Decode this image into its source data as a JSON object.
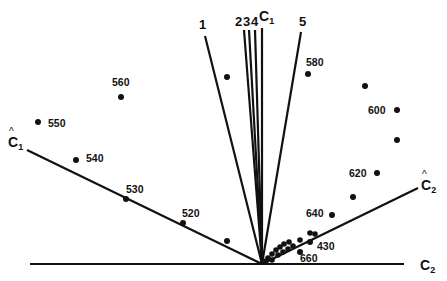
{
  "diagram": {
    "origin_label": "",
    "axes": [
      {
        "id": "c2",
        "label": "C",
        "subscript": "2",
        "hat": false
      },
      {
        "id": "c1-hat",
        "label": "C",
        "subscript": "1",
        "hat": true
      },
      {
        "id": "c2-hat",
        "label": "C",
        "subscript": "2",
        "hat": true
      }
    ],
    "vectors": [
      {
        "id": "v1",
        "label": "1"
      },
      {
        "id": "v2",
        "label": "2"
      },
      {
        "id": "v3",
        "label": "3"
      },
      {
        "id": "v4",
        "label": "4"
      },
      {
        "id": "vc1",
        "label": "C",
        "subscript": "1"
      },
      {
        "id": "v5",
        "label": "5"
      }
    ],
    "points": [
      {
        "label": "550"
      },
      {
        "label": "560"
      },
      {
        "label": "540"
      },
      {
        "label": "530"
      },
      {
        "label": "520"
      },
      {
        "label": ""
      },
      {
        "label": ""
      },
      {
        "label": "580"
      },
      {
        "label": ""
      },
      {
        "label": "600"
      },
      {
        "label": ""
      },
      {
        "label": "620"
      },
      {
        "label": ""
      },
      {
        "label": "640"
      },
      {
        "label": "430"
      },
      {
        "label": "660"
      }
    ],
    "color": "#111111"
  }
}
